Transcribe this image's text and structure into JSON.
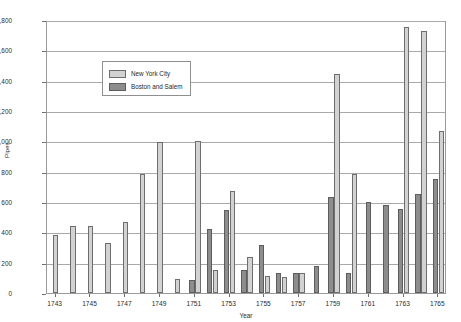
{
  "chart_data": {
    "type": "bar",
    "title": "",
    "xlabel": "Year",
    "ylabel": "Pipes",
    "ylim": [
      0,
      1800
    ],
    "ytick_step": 200,
    "ytick_labels": [
      "0",
      "200",
      "400",
      "600",
      "800",
      "1,000",
      "1,200",
      "1,400",
      "1,600",
      "1,800"
    ],
    "grid": true,
    "legend_position": "top-left",
    "categories": [
      1743,
      1744,
      1745,
      1746,
      1747,
      1748,
      1749,
      1750,
      1751,
      1752,
      1753,
      1754,
      1755,
      1756,
      1757,
      1758,
      1759,
      1760,
      1761,
      1762,
      1763,
      1764,
      1765
    ],
    "xtick_labels": [
      "1743",
      "1745",
      "1747",
      "1749",
      "1751",
      "1753",
      "1755",
      "1757",
      "1759",
      "1761",
      "1763",
      "1765"
    ],
    "series": [
      {
        "name": "New York City",
        "color": "#d2d2d2",
        "values": [
          380,
          440,
          440,
          330,
          470,
          785,
          995,
          90,
          1000,
          150,
          675,
          240,
          115,
          105,
          130,
          0,
          1445,
          785,
          0,
          0,
          1755,
          1725,
          1070
        ]
      },
      {
        "name": "Boston and Salem",
        "color": "#8d8d8d",
        "values": [
          0,
          0,
          0,
          0,
          0,
          0,
          0,
          0,
          85,
          425,
          545,
          155,
          315,
          135,
          130,
          175,
          635,
          130,
          600,
          580,
          555,
          655,
          750
        ]
      }
    ]
  },
  "legend": {
    "items": [
      {
        "label": "New York City",
        "swatch": "nyc"
      },
      {
        "label": "Boston and Salem",
        "swatch": "bos"
      }
    ]
  },
  "axes": {
    "x_title": "Year",
    "y_title": "Pipes"
  }
}
